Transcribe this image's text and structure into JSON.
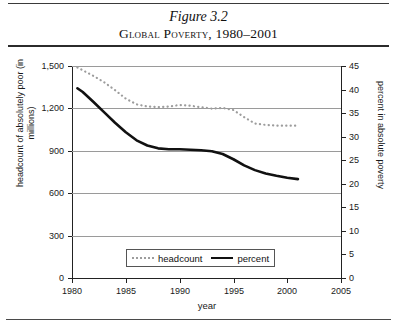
{
  "figure": {
    "number": "Figure 3.2",
    "title": "Global Poverty, 1980–2001"
  },
  "chart_data": {
    "type": "line",
    "title": "Global Poverty, 1980–2001",
    "subtitle": "Figure 3.2",
    "xlabel": "year",
    "ylabel": "headcount of absolutely poor (in millions)",
    "y2label": "percent in absolute poverty",
    "xlim": [
      1980,
      2005
    ],
    "ylim": [
      0,
      1500
    ],
    "y2lim": [
      0,
      45
    ],
    "xticks": [
      1980,
      1985,
      1990,
      1995,
      2000,
      2005
    ],
    "xticklabels": [
      "1980",
      "1985",
      "1990",
      "1995",
      "2000",
      "2005"
    ],
    "yticks": [
      0,
      300,
      600,
      900,
      1200,
      1500
    ],
    "yticklabels": [
      "0",
      "300",
      "600",
      "900",
      "1,200",
      "1,500"
    ],
    "y2ticks": [
      0,
      5,
      10,
      15,
      20,
      25,
      30,
      35,
      40,
      45
    ],
    "y2ticklabels": [
      "0",
      "5",
      "10",
      "15",
      "20",
      "25",
      "30",
      "35",
      "40",
      "45"
    ],
    "grid": "horizontal",
    "legend_position": "inside-lower-center",
    "series": [
      {
        "name": "headcount",
        "axis": "left",
        "style": "dotted",
        "color": "#9d9d9d",
        "x": [
          1980.5,
          1981,
          1982,
          1983,
          1984,
          1985,
          1986,
          1987,
          1988,
          1989,
          1990,
          1991,
          1992,
          1993,
          1994,
          1995,
          1996,
          1997,
          1998,
          1999,
          2000,
          2001
        ],
        "values": [
          1490,
          1470,
          1430,
          1385,
          1330,
          1270,
          1230,
          1215,
          1210,
          1215,
          1225,
          1220,
          1210,
          1200,
          1205,
          1190,
          1140,
          1095,
          1085,
          1080,
          1080,
          1080
        ]
      },
      {
        "name": "percent",
        "axis": "right",
        "style": "solid",
        "color": "#111111",
        "x": [
          1980.5,
          1981,
          1982,
          1983,
          1984,
          1985,
          1986,
          1987,
          1988,
          1989,
          1990,
          1991,
          1992,
          1993,
          1994,
          1995,
          1996,
          1997,
          1998,
          1999,
          2000,
          2001
        ],
        "values": [
          40.3,
          39.5,
          37.4,
          35.2,
          33.0,
          31.0,
          29.3,
          28.2,
          27.6,
          27.4,
          27.4,
          27.3,
          27.2,
          27.0,
          26.4,
          25.3,
          24.0,
          23.0,
          22.3,
          21.8,
          21.4,
          21.1
        ]
      }
    ],
    "legend": [
      {
        "label": "headcount",
        "style": "dotted"
      },
      {
        "label": "percent",
        "style": "solid"
      }
    ]
  }
}
